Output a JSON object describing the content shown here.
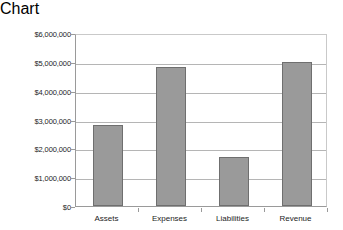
{
  "chart_data": {
    "type": "bar",
    "title": "",
    "subtitle": "",
    "xlabel": "",
    "ylabel": "",
    "categories": [
      "Assets",
      "Expenses",
      "Liabilities",
      "Revenue"
    ],
    "values": [
      2800000,
      4820000,
      1700000,
      4980000
    ],
    "ylim": [
      0,
      6000000
    ],
    "ytick_values": [
      0,
      1000000,
      2000000,
      3000000,
      4000000,
      5000000,
      6000000
    ],
    "ytick_labels": [
      "$0",
      "$1,000,000",
      "$2,000,000",
      "$3,000,000",
      "$4,000,000",
      "$5,000,000",
      "$6,000,000"
    ],
    "grid": true,
    "grid_axis": "y",
    "legend": false,
    "legend_position": "none",
    "annotations": [],
    "series": [
      {
        "name": "Amount",
        "values": [
          2800000,
          4820000,
          1700000,
          4980000
        ]
      }
    ]
  },
  "style": {
    "background": "#ffffff",
    "bar_fill": "#9a9a9a",
    "bar_border": "#6f6f6f",
    "gridline_color": "#b5b5b5",
    "axis_color": "#9a9a9a",
    "text_color": "#1d1d1d"
  }
}
